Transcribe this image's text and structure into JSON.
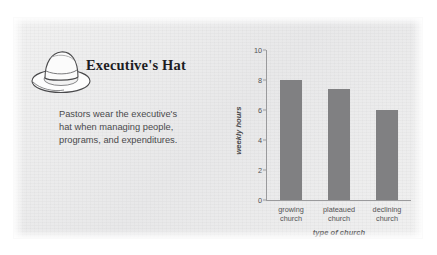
{
  "card": {
    "title": "Executive's Hat",
    "icon": "hat-icon",
    "body_lines": [
      "Pastors wear the executive's",
      "hat when managing people,",
      "programs, and expenditures."
    ]
  },
  "colors": {
    "bar": "#808082",
    "axis": "#9a9a9c",
    "panel": "#ececed",
    "title_text": "#1d1d1f",
    "body_text": "#4a4a4c"
  },
  "chart_data": {
    "type": "bar",
    "title": "",
    "xlabel": "type of church",
    "ylabel": "weekly hours",
    "categories": [
      "growing church",
      "plateaued church",
      "declining church"
    ],
    "category_lines": [
      [
        "growing",
        "church"
      ],
      [
        "plateaued",
        "church"
      ],
      [
        "declining",
        "church"
      ]
    ],
    "values": [
      8.0,
      7.4,
      6.0
    ],
    "ylim": [
      0,
      10
    ],
    "yticks": [
      0,
      2,
      4,
      6,
      8,
      10
    ],
    "ytick_labels": [
      "0",
      "2",
      "4",
      "6",
      "8",
      "10"
    ],
    "grid": false,
    "legend": false
  }
}
